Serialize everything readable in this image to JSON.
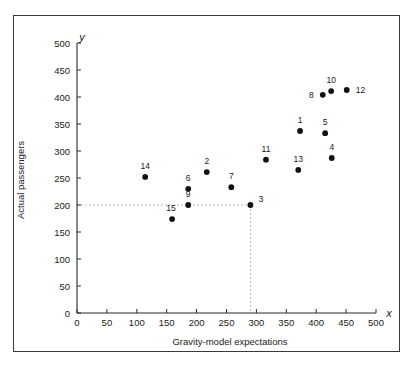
{
  "chart_data": {
    "type": "scatter",
    "title": "",
    "xlabel": "Gravity-model expectations",
    "ylabel": "Actual passengers",
    "x_axis_variable": "x",
    "y_axis_variable": "y",
    "xlim": [
      0,
      500
    ],
    "ylim": [
      0,
      500
    ],
    "xticks": [
      0,
      50,
      100,
      150,
      200,
      250,
      300,
      350,
      400,
      450,
      500
    ],
    "yticks": [
      0,
      50,
      100,
      150,
      200,
      250,
      300,
      350,
      400,
      450,
      500
    ],
    "xtick_labels": [
      "0",
      "50",
      "100",
      "150",
      "200",
      "250",
      "300",
      "350",
      "400",
      "450",
      "500"
    ],
    "ytick_labels": [
      "0",
      "50",
      "100",
      "150",
      "200",
      "250",
      "300",
      "350",
      "400",
      "450",
      "500"
    ],
    "grid": false,
    "legend": null,
    "point_color": "#111111",
    "guide_color": "#b9b9b9",
    "points": [
      {
        "label": "14",
        "x": 114,
        "y": 252,
        "label_dx": 0,
        "label_dy": -8
      },
      {
        "label": "15",
        "x": 159,
        "y": 174,
        "label_dx": -1,
        "label_dy": -8
      },
      {
        "label": "6",
        "x": 186,
        "y": 230,
        "label_dx": 0,
        "label_dy": -8
      },
      {
        "label": "9",
        "x": 186,
        "y": 200,
        "label_dx": 0,
        "label_dy": -8
      },
      {
        "label": "2",
        "x": 217,
        "y": 261,
        "label_dx": 0,
        "label_dy": -8
      },
      {
        "label": "7",
        "x": 258,
        "y": 233,
        "label_dx": 0,
        "label_dy": -8
      },
      {
        "label": "3",
        "x": 290,
        "y": 200,
        "label_dx": 8,
        "label_dy": -3
      },
      {
        "label": "11",
        "x": 316,
        "y": 284,
        "label_dx": 0,
        "label_dy": -8
      },
      {
        "label": "13",
        "x": 370,
        "y": 265,
        "label_dx": 0,
        "label_dy": -8
      },
      {
        "label": "1",
        "x": 373,
        "y": 337,
        "label_dx": 0,
        "label_dy": -8
      },
      {
        "label": "4",
        "x": 426,
        "y": 287,
        "label_dx": 0,
        "label_dy": -8
      },
      {
        "label": "5",
        "x": 415,
        "y": 333,
        "label_dx": 0,
        "label_dy": -8
      },
      {
        "label": "8",
        "x": 411,
        "y": 404,
        "label_dx": -9,
        "label_dy": 3
      },
      {
        "label": "10",
        "x": 425,
        "y": 411,
        "label_dx": 0,
        "label_dy": -8
      },
      {
        "label": "12",
        "x": 451,
        "y": 413,
        "label_dx": 9,
        "label_dy": 3
      }
    ],
    "annotations": [
      {
        "name": "guide-horizontal",
        "from_x": 0,
        "from_y": 200,
        "to_x": 290,
        "to_y": 200
      },
      {
        "name": "guide-vertical",
        "from_x": 290,
        "from_y": 200,
        "to_x": 290,
        "to_y": 0
      }
    ]
  }
}
